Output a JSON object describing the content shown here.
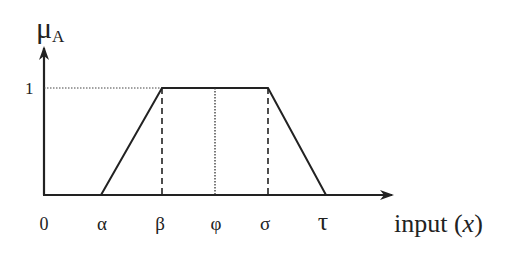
{
  "diagram": {
    "type": "trapezoidal-membership-function",
    "y_axis_label": "μ",
    "y_axis_subscript": "A",
    "y_level_label": "1",
    "x_axis_label": "input (x)",
    "x_axis_label_parts": {
      "prefix": "input (",
      "var": "x",
      "suffix": ")"
    },
    "x_ticks": [
      "0",
      "α",
      "β",
      "φ",
      "σ",
      "τ"
    ],
    "points": [
      {
        "name": "alpha",
        "label": "α",
        "membership": 0
      },
      {
        "name": "beta",
        "label": "β",
        "membership": 1
      },
      {
        "name": "phi",
        "label": "φ",
        "membership": 1
      },
      {
        "name": "sigma",
        "label": "σ",
        "membership": 1
      },
      {
        "name": "tau",
        "label": "τ",
        "membership": 0
      }
    ],
    "line_color": "#222222"
  }
}
